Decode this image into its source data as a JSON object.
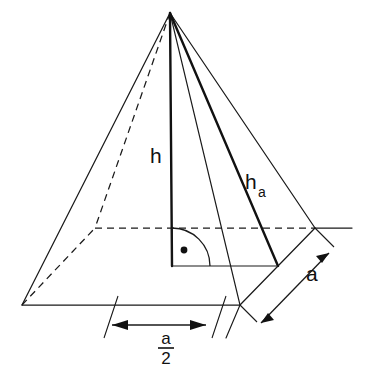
{
  "figure": {
    "background_color": "#ffffff",
    "line_color": "#1a1a1a",
    "width": 368,
    "height": 370
  },
  "labels": {
    "height": "h",
    "slant_height_base": "h",
    "slant_height_subscript": "a",
    "base_edge": "a",
    "half_edge_numerator": "a",
    "half_edge_denominator": "2"
  },
  "geometry": {
    "apex": {
      "x": 170,
      "y": 13
    },
    "base_front_left": {
      "x": 22,
      "y": 305
    },
    "base_front_right": {
      "x": 240,
      "y": 305
    },
    "base_back_right": {
      "x": 315,
      "y": 228
    },
    "base_back_left": {
      "x": 95,
      "y": 228
    },
    "base_center": {
      "x": 172,
      "y": 266
    },
    "right_edge_midpoint": {
      "x": 278,
      "y": 266
    },
    "front_edge_midpoint": {
      "x": 131,
      "y": 305
    }
  },
  "annotations": {
    "right_angle_marker": "quarter-arc-with-dot",
    "dimension_a": "arrow both ends along right base edge",
    "dimension_a_half": "arrow both ends below front base edge",
    "hidden_lines": "dashed rear edges of base and rear lateral edge"
  }
}
